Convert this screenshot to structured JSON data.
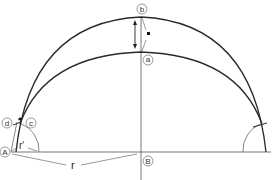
{
  "diagram": {
    "points": {
      "a": "a",
      "b": "b",
      "c": "c",
      "d": "d",
      "A": "A",
      "B": "B"
    },
    "dimensions": {
      "r": "r",
      "r_prime": "r′"
    },
    "colors": {
      "stroke": "#2a2a2a",
      "thin": "#555555"
    }
  }
}
